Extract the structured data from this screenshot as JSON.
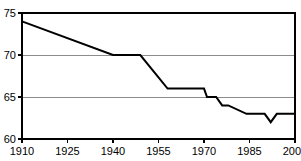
{
  "chart_data": {
    "type": "line",
    "title": "",
    "subtitle": "",
    "xlabel": "",
    "ylabel": "",
    "xlim": [
      1910,
      2000
    ],
    "ylim": [
      60,
      75
    ],
    "grid": true,
    "grid_axis": "y",
    "legend": false,
    "legend_position": "none",
    "line_color": "#000000",
    "grid_color": "#8c8c8c",
    "frame_color": "#000000",
    "background_color": "#ffffff",
    "x_ticks": [
      1910,
      1925,
      1940,
      1955,
      1970,
      1985,
      2000
    ],
    "x_tick_labels": [
      "1910",
      "1925",
      "1940",
      "1955",
      "1970",
      "1985",
      "2000"
    ],
    "y_ticks": [
      60,
      65,
      70,
      75
    ],
    "y_tick_labels": [
      "60",
      "65",
      "70",
      "75"
    ],
    "series": [
      {
        "name": "value",
        "x": [
          1910,
          1940,
          1949,
          1958,
          1970,
          1971,
          1974,
          1976,
          1978,
          1984,
          1990,
          1992,
          1994,
          2000
        ],
        "values": [
          74,
          70,
          70,
          66,
          66,
          65,
          65,
          64,
          64,
          63,
          63,
          62,
          63,
          63
        ]
      }
    ]
  },
  "annotations": {
    "cropped_title_ghost": ""
  }
}
